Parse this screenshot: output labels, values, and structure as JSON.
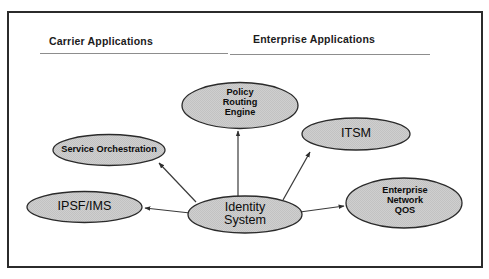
{
  "figure": {
    "background_color": "#ffffff",
    "border_color": "#2b2b2b",
    "node_fill_color": "#cccccc",
    "node_stroke_color": "#2a2a2a",
    "connector_color": "#3a3a3a",
    "rule_color": "#8d8d8d"
  },
  "headings": [
    {
      "id": "carrier",
      "label": "Carrier Applications"
    },
    {
      "id": "enterprise",
      "label": "Enterprise Applications"
    }
  ],
  "nodes": [
    {
      "id": "policy-routing-engine",
      "label": "Policy\nRouting\nEngine",
      "style": "bold"
    },
    {
      "id": "service-orchestration",
      "label": "Service Orchestration",
      "style": "bold"
    },
    {
      "id": "ipsf-ims",
      "label": "IPSF/IMS",
      "style": "plain"
    },
    {
      "id": "identity-system",
      "label": "Identity\nSystem",
      "style": "plain"
    },
    {
      "id": "itsm",
      "label": "ITSM",
      "style": "plain"
    },
    {
      "id": "enterprise-network-qos",
      "label": "Enterprise\nNetwork\nQOS",
      "style": "bold"
    }
  ],
  "connectors": [
    {
      "id": "identity-to-policy-routing-engine",
      "from": "identity-system",
      "to": "policy-routing-engine",
      "arrow": "to"
    },
    {
      "id": "identity-to-service-orchestration",
      "from": "identity-system",
      "to": "service-orchestration",
      "arrow": "to"
    },
    {
      "id": "identity-to-ipsf-ims",
      "from": "identity-system",
      "to": "ipsf-ims",
      "arrow": "to"
    },
    {
      "id": "identity-to-itsm",
      "from": "identity-system",
      "to": "itsm",
      "arrow": "to"
    },
    {
      "id": "identity-to-enterprise-network-qos",
      "from": "identity-system",
      "to": "enterprise-network-qos",
      "arrow": "to"
    }
  ]
}
